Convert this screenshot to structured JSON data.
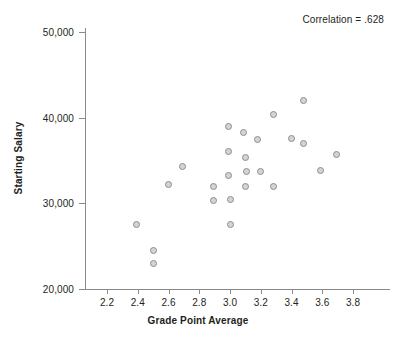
{
  "chart_data": {
    "type": "scatter",
    "title": "",
    "xlabel": "Grade Point Average",
    "ylabel": "Starting Salary",
    "xlim": [
      2.1,
      3.88
    ],
    "ylim": [
      20000,
      50500
    ],
    "grid": false,
    "legend": null,
    "annotations": [
      {
        "text": "Correlation = .628",
        "position": "top-right"
      }
    ],
    "xticks": [
      2.2,
      2.4,
      2.6,
      2.8,
      3.0,
      3.2,
      3.4,
      3.6,
      3.8
    ],
    "xtick_labels": [
      "2.2",
      "2.4",
      "2.6",
      "2.8",
      "3.0",
      "3.2",
      "3.4",
      "3.6",
      "3.8"
    ],
    "yticks": [
      20000,
      30000,
      40000,
      50000
    ],
    "ytick_labels": [
      "20,000",
      "30,000",
      "40,000",
      "50,000"
    ],
    "marker": {
      "shape": "circle",
      "fill": "#d4d4d4",
      "edge": "#8d8d8d",
      "size": 7
    },
    "points": [
      {
        "x": 2.39,
        "y": 27500
      },
      {
        "x": 2.5,
        "y": 24500
      },
      {
        "x": 2.5,
        "y": 23000
      },
      {
        "x": 2.6,
        "y": 32200
      },
      {
        "x": 2.69,
        "y": 34300
      },
      {
        "x": 2.89,
        "y": 32000
      },
      {
        "x": 2.89,
        "y": 30300
      },
      {
        "x": 2.99,
        "y": 39000
      },
      {
        "x": 2.99,
        "y": 36100
      },
      {
        "x": 2.99,
        "y": 33300
      },
      {
        "x": 3.0,
        "y": 30400
      },
      {
        "x": 3.0,
        "y": 27500
      },
      {
        "x": 3.09,
        "y": 38300
      },
      {
        "x": 3.1,
        "y": 35300
      },
      {
        "x": 3.11,
        "y": 33700
      },
      {
        "x": 3.1,
        "y": 32000
      },
      {
        "x": 3.18,
        "y": 37500
      },
      {
        "x": 3.2,
        "y": 33700
      },
      {
        "x": 3.28,
        "y": 40400
      },
      {
        "x": 3.28,
        "y": 32000
      },
      {
        "x": 3.4,
        "y": 37600
      },
      {
        "x": 3.48,
        "y": 42000
      },
      {
        "x": 3.48,
        "y": 37000
      },
      {
        "x": 3.59,
        "y": 33800
      },
      {
        "x": 3.69,
        "y": 35700
      }
    ]
  },
  "axes": {
    "x_title": "Grade Point Average",
    "y_title": "Starting Salary"
  },
  "annotation": {
    "correlation_text": "Correlation = .628"
  }
}
